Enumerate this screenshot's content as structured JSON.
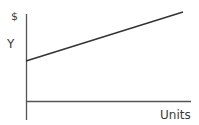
{
  "diagram": {
    "y_axis_unit_label": "$",
    "y_intercept_label": "Y",
    "x_axis_label": "Units",
    "line": {
      "description": "upward sloping line starting at Y-intercept",
      "start": {
        "x": 26,
        "y": 61
      },
      "end": {
        "x": 183,
        "y": 12
      }
    },
    "colors": {
      "line": "#333333",
      "axis": "#555555",
      "text": "#3a3a3a"
    }
  }
}
